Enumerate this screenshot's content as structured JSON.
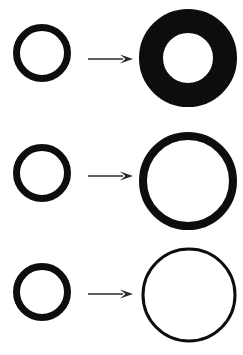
{
  "figure": {
    "width": 243,
    "height": 355,
    "background_color": "#ffffff",
    "ink_color": "#0d0d0d",
    "arrow_color": "#2b2b2b"
  },
  "rows": [
    {
      "id": "row-1",
      "label": "Row 1: small ring becomes thick annulus",
      "center_y": 53,
      "source": {
        "name": "small-ring",
        "shape": "ring",
        "cx": 42,
        "cy": 53,
        "outer_diameter": 58,
        "stroke_width": 7,
        "fill": "none",
        "stroke": "#0d0d0d"
      },
      "arrow": {
        "name": "transform-arrow",
        "x1": 88,
        "x2": 133,
        "y": 59,
        "stroke_width": 1.6,
        "head_length": 13,
        "head_width": 9,
        "color": "#2b2b2b"
      },
      "result": {
        "name": "large-thick-annulus",
        "shape": "ring",
        "cx": 188,
        "cy": 58,
        "outer_diameter": 98,
        "inner_diameter": 50,
        "stroke_width": 24,
        "fill": "none",
        "stroke": "#0d0d0d"
      }
    },
    {
      "id": "row-2",
      "label": "Row 2: small ring becomes large medium-stroke circle",
      "center_y": 180,
      "source": {
        "name": "small-ring",
        "shape": "ring",
        "cx": 42,
        "cy": 173,
        "outer_diameter": 58,
        "stroke_width": 7,
        "fill": "none",
        "stroke": "#0d0d0d"
      },
      "arrow": {
        "name": "transform-arrow",
        "x1": 88,
        "x2": 133,
        "y": 176,
        "stroke_width": 1.6,
        "head_length": 13,
        "head_width": 9,
        "color": "#2b2b2b"
      },
      "result": {
        "name": "large-medium-ring",
        "shape": "ring",
        "cx": 188,
        "cy": 181,
        "outer_diameter": 98,
        "inner_diameter": 82,
        "stroke_width": 8,
        "fill": "none",
        "stroke": "#0d0d0d"
      }
    },
    {
      "id": "row-3",
      "label": "Row 3: small ring becomes large thin-stroke circle",
      "center_y": 295,
      "source": {
        "name": "small-ring",
        "shape": "ring",
        "cx": 42,
        "cy": 292,
        "outer_diameter": 58,
        "stroke_width": 7,
        "fill": "none",
        "stroke": "#0d0d0d"
      },
      "arrow": {
        "name": "transform-arrow",
        "x1": 88,
        "x2": 133,
        "y": 294,
        "stroke_width": 1.6,
        "head_length": 13,
        "head_width": 9,
        "color": "#2b2b2b"
      },
      "result": {
        "name": "large-thin-ring",
        "shape": "ring",
        "cx": 189,
        "cy": 295,
        "outer_diameter": 95,
        "inner_diameter": 89,
        "stroke_width": 3,
        "fill": "none",
        "stroke": "#0d0d0d"
      }
    }
  ]
}
